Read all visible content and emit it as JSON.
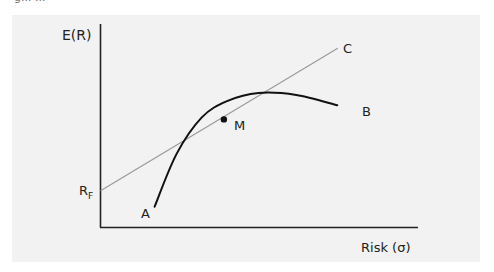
{
  "figure": {
    "caption_fragment": "g...                    ..."
  },
  "chart_data": {
    "type": "line",
    "xlabel": "Risk (σ)",
    "ylabel": "E(R)",
    "grid": false,
    "axis_ticks": "none",
    "xlim": [
      0,
      1
    ],
    "ylim": [
      0,
      1
    ],
    "risk_free_label": "R",
    "risk_free_subscript": "F",
    "series": [
      {
        "name": "Capital Market Line",
        "label": "C",
        "style": "thin gray straight line",
        "color": "#9a9a9a",
        "x": [
          0.0,
          0.75
        ],
        "y": [
          0.18,
          0.88
        ]
      },
      {
        "name": "Efficient Frontier",
        "start_label": "A",
        "end_label": "B",
        "style": "thick black concave curve",
        "color": "#111111",
        "x": [
          0.17,
          0.24,
          0.32,
          0.4,
          0.5,
          0.62,
          0.75
        ],
        "y": [
          0.1,
          0.36,
          0.54,
          0.62,
          0.66,
          0.65,
          0.6
        ]
      }
    ],
    "points": [
      {
        "name": "Market Portfolio",
        "label": "M",
        "x": 0.39,
        "y": 0.53
      }
    ]
  }
}
